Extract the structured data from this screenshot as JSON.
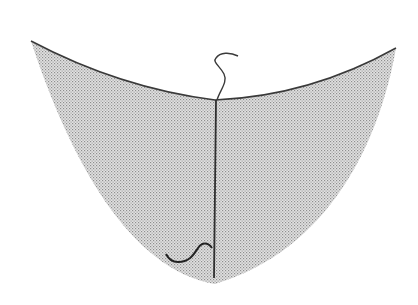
{
  "figure": {
    "colors": {
      "background": "#ffffff",
      "outline": "#3a3a3a",
      "stipple_dot": "#9a9a9a",
      "stipple_fill": "#d8d8d8"
    },
    "elements": [
      {
        "name": "top-rim-curve",
        "type": "curve"
      },
      {
        "name": "stippled-body",
        "type": "shaded-region"
      },
      {
        "name": "center-vertical-line",
        "type": "line"
      },
      {
        "name": "top-wavy-hook",
        "type": "curve"
      },
      {
        "name": "bottom-wavy-hook",
        "type": "curve"
      }
    ]
  }
}
